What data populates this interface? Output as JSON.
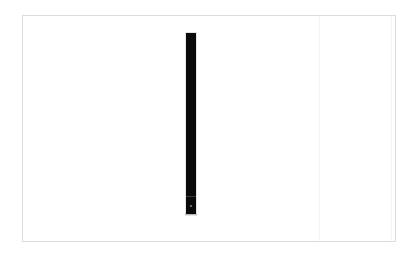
{
  "window": {
    "title": ""
  },
  "panel": {
    "border_color": "#dcdcdc",
    "background": "#ffffff"
  },
  "bar": {
    "color": "#0a0a0a",
    "orientation": "vertical",
    "grip_icon": "grip-dot-icon"
  }
}
